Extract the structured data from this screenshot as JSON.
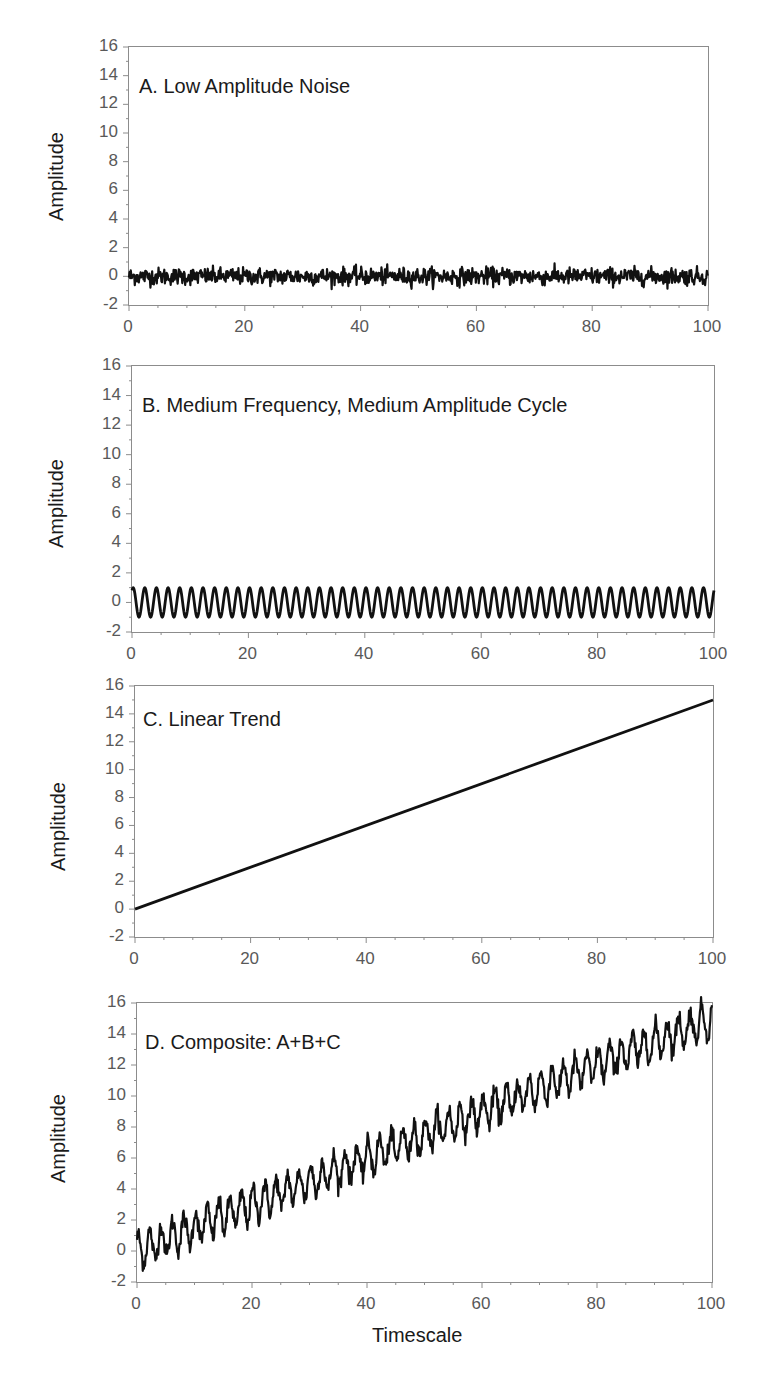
{
  "figure": {
    "xlabel": "Timescale",
    "ylabel": "Amplitude",
    "y_ticks": [
      "16",
      "14",
      "12",
      "10",
      "8",
      "6",
      "4",
      "2",
      "0",
      "-2"
    ],
    "x_ticks": [
      "0",
      "20",
      "40",
      "60",
      "80",
      "100"
    ],
    "line_color": "#111111",
    "axis_color": "#8c8c8c",
    "tick_label_color": "#595959"
  },
  "panels": [
    {
      "id": "A",
      "title": "A. Low Amplitude Noise"
    },
    {
      "id": "B",
      "title": "B. Medium Frequency, Medium Amplitude Cycle"
    },
    {
      "id": "C",
      "title": "C. Linear Trend"
    },
    {
      "id": "D",
      "title": "D. Composite: A+B+C"
    }
  ],
  "chart_data": [
    {
      "type": "line",
      "title": "A. Low Amplitude Noise",
      "xlabel": "",
      "ylabel": "Amplitude",
      "xlim": [
        0,
        100
      ],
      "ylim": [
        -2,
        16
      ],
      "x_ticks": [
        0,
        20,
        40,
        60,
        80,
        100
      ],
      "y_ticks": [
        -2,
        0,
        2,
        4,
        6,
        8,
        10,
        12,
        14,
        16
      ],
      "grid": false,
      "series": [
        {
          "name": "noise",
          "description": "random noise centered at 0",
          "mean": 0,
          "range": [
            -0.9,
            0.9
          ],
          "approx_std": 0.35
        }
      ]
    },
    {
      "type": "line",
      "title": "B. Medium Frequency, Medium Amplitude Cycle",
      "xlabel": "",
      "ylabel": "Amplitude",
      "xlim": [
        0,
        100
      ],
      "ylim": [
        -2,
        16
      ],
      "x_ticks": [
        0,
        20,
        40,
        60,
        80,
        100
      ],
      "y_ticks": [
        -2,
        0,
        2,
        4,
        6,
        8,
        10,
        12,
        14,
        16
      ],
      "grid": false,
      "series": [
        {
          "name": "cycle",
          "description": "sine wave",
          "amplitude": 1,
          "period": 2,
          "cycles": 50,
          "range": [
            -1,
            1
          ]
        }
      ]
    },
    {
      "type": "line",
      "title": "C. Linear Trend",
      "xlabel": "",
      "ylabel": "Amplitude",
      "xlim": [
        0,
        100
      ],
      "ylim": [
        -2,
        16
      ],
      "x_ticks": [
        0,
        20,
        40,
        60,
        80,
        100
      ],
      "y_ticks": [
        -2,
        0,
        2,
        4,
        6,
        8,
        10,
        12,
        14,
        16
      ],
      "grid": false,
      "series": [
        {
          "name": "trend",
          "x": [
            0,
            100
          ],
          "y": [
            0,
            15
          ],
          "slope": 0.15
        }
      ]
    },
    {
      "type": "line",
      "title": "D. Composite: A+B+C",
      "xlabel": "Timescale",
      "ylabel": "Amplitude",
      "xlim": [
        0,
        100
      ],
      "ylim": [
        -2,
        16
      ],
      "x_ticks": [
        0,
        20,
        40,
        60,
        80,
        100
      ],
      "y_ticks": [
        -2,
        0,
        2,
        4,
        6,
        8,
        10,
        12,
        14,
        16
      ],
      "grid": false,
      "series": [
        {
          "name": "composite",
          "description": "noise + sine(period 2, amp 1) + 0.15x",
          "start_range": [
            -1.4,
            1.8
          ],
          "end_range": [
            14,
            16.2
          ]
        }
      ]
    }
  ]
}
